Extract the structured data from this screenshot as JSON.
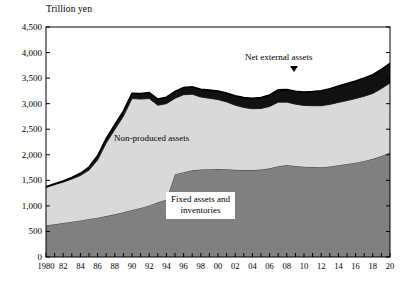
{
  "chart_data": {
    "type": "area",
    "stacked": true,
    "title": "",
    "unit_label": "Trillion yen",
    "xlabel": "",
    "ylabel": "",
    "ylim": [
      0,
      4500
    ],
    "ytick_values": [
      0,
      500,
      1000,
      1500,
      2000,
      2500,
      3000,
      3500,
      4000,
      4500
    ],
    "ytick_labels": [
      "0",
      "500",
      "1,000",
      "1,500",
      "2,000",
      "2,500",
      "3,000",
      "3,500",
      "4,000",
      "4,500"
    ],
    "xlim": [
      1980,
      2020
    ],
    "xtick_values": [
      1980,
      1982,
      1984,
      1986,
      1988,
      1990,
      1992,
      1994,
      1996,
      1998,
      2000,
      2002,
      2004,
      2006,
      2008,
      2010,
      2012,
      2014,
      2016,
      2018,
      2020
    ],
    "xtick_labels": [
      "1980",
      "82",
      "84",
      "86",
      "88",
      "90",
      "92",
      "94",
      "96",
      "98",
      "00",
      "02",
      "04",
      "06",
      "08",
      "10",
      "12",
      "14",
      "16",
      "18",
      "20"
    ],
    "grid": false,
    "legend_position": "inline-annotations",
    "x": [
      1980,
      1981,
      1982,
      1983,
      1984,
      1985,
      1986,
      1987,
      1988,
      1989,
      1990,
      1991,
      1992,
      1993,
      1994,
      1995,
      1996,
      1997,
      1998,
      1999,
      2000,
      2001,
      2002,
      2003,
      2004,
      2005,
      2006,
      2007,
      2008,
      2009,
      2010,
      2011,
      2012,
      2013,
      2014,
      2015,
      2016,
      2017,
      2018,
      2019,
      2020
    ],
    "series": [
      {
        "name": "Fixed assets and inventories",
        "color": "#808080",
        "values": [
          620,
          640,
          665,
          690,
          715,
          745,
          770,
          800,
          835,
          875,
          920,
          960,
          1010,
          1070,
          1120,
          1620,
          1660,
          1695,
          1710,
          1715,
          1720,
          1715,
          1705,
          1700,
          1700,
          1710,
          1735,
          1775,
          1800,
          1780,
          1765,
          1760,
          1755,
          1770,
          1795,
          1820,
          1845,
          1880,
          1920,
          1975,
          2045
        ]
      },
      {
        "name": "Non-produced assets",
        "color": "#d9d9d9",
        "values": [
          740,
          775,
          800,
          835,
          880,
          955,
          1130,
          1430,
          1660,
          1880,
          2180,
          2130,
          2090,
          1900,
          1880,
          1485,
          1515,
          1490,
          1420,
          1390,
          1360,
          1320,
          1265,
          1225,
          1200,
          1195,
          1210,
          1255,
          1230,
          1210,
          1200,
          1200,
          1205,
          1215,
          1230,
          1240,
          1255,
          1265,
          1280,
          1320,
          1360
        ]
      },
      {
        "name": "Net external assets",
        "color": "#111111",
        "values": [
          15,
          18,
          22,
          30,
          42,
          60,
          80,
          90,
          95,
          100,
          105,
          110,
          115,
          120,
          125,
          135,
          140,
          145,
          150,
          160,
          165,
          175,
          185,
          195,
          205,
          215,
          225,
          240,
          245,
          250,
          260,
          275,
          290,
          305,
          320,
          335,
          345,
          355,
          365,
          375,
          385
        ]
      }
    ],
    "annotations": [
      {
        "name": "non-produced-assets-label",
        "text": "Non-produced assets"
      },
      {
        "name": "net-external-assets-label",
        "text": "Net external assets"
      },
      {
        "name": "fixed-assets-label",
        "line1": "Fixed assets and",
        "line2": "inventories"
      }
    ]
  }
}
